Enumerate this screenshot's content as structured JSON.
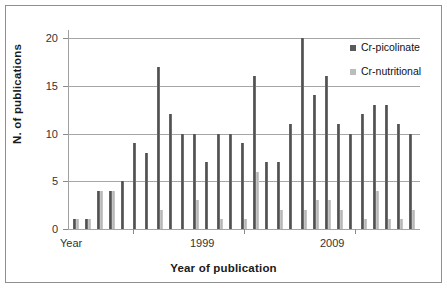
{
  "chart_data": {
    "type": "bar",
    "title": "",
    "xlabel": "Year of publication",
    "ylabel": "N. of publications",
    "ylim": [
      0,
      20
    ],
    "yticks": [
      0,
      5,
      10,
      15,
      20
    ],
    "grid": true,
    "legend_position": "top-right",
    "x_tick_labels": [
      "Year",
      "1999",
      "2009"
    ],
    "categories": [
      "1",
      "2",
      "3",
      "4",
      "5",
      "6",
      "7",
      "8",
      "9",
      "10",
      "11",
      "12",
      "13",
      "14",
      "15",
      "16",
      "17",
      "18",
      "19",
      "20",
      "21",
      "22",
      "23",
      "24",
      "25",
      "26",
      "27",
      "28",
      "29"
    ],
    "series": [
      {
        "name": "Cr-picolinate",
        "color": "#5a5a5a",
        "values": [
          1,
          1,
          4,
          4,
          5,
          9,
          8,
          17,
          12,
          10,
          10,
          7,
          10,
          10,
          9,
          16,
          7,
          7,
          11,
          20,
          14,
          16,
          11,
          10,
          12,
          13,
          13,
          11,
          10
        ]
      },
      {
        "name": "Cr-nutritional",
        "color": "#bcbcbc",
        "values": [
          1,
          1,
          4,
          4,
          0,
          0,
          0,
          2,
          0,
          0,
          3,
          0,
          1,
          0,
          1,
          6,
          0,
          2,
          0,
          2,
          3,
          3,
          2,
          0,
          1,
          4,
          1,
          1,
          2
        ]
      }
    ]
  },
  "axis": {
    "y_tick_labels": [
      "20",
      "15",
      "10",
      "5",
      "0"
    ],
    "y_title": "N.  of  publications",
    "x_title": "Year of publication",
    "x_labels": [
      {
        "text": "Year",
        "left": 60
      },
      {
        "text": "1999",
        "left": 190
      },
      {
        "text": "2009",
        "left": 320
      }
    ]
  },
  "legend": {
    "items": [
      {
        "label": "Cr-picolinate",
        "color": "#5a5a5a"
      },
      {
        "label": "Cr-nutritional",
        "color": "#bcbcbc"
      }
    ]
  },
  "colors": {
    "picolinate": "#5a5a5a",
    "nutritional": "#bcbcbc",
    "grid": "#a6a6a6",
    "frame": "#8f8f8f",
    "text": "#333333"
  }
}
